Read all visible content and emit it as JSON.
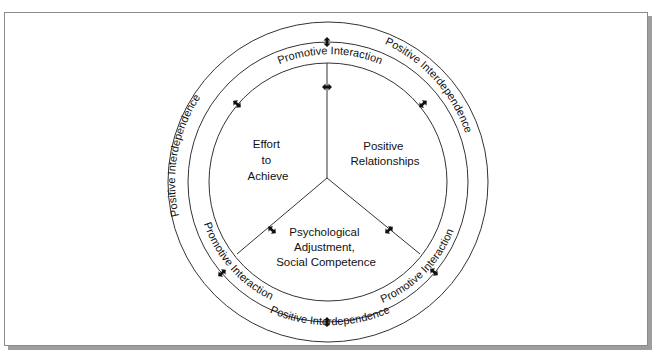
{
  "diagram": {
    "outer_ring_label": "Positive Interdependence",
    "inner_ring_label": "Promotive Interaction",
    "sectors": [
      {
        "id": "effort",
        "lines": [
          "Effort",
          "to",
          "Achieve"
        ]
      },
      {
        "id": "relationships",
        "lines": [
          "Positive",
          "Relationships"
        ]
      },
      {
        "id": "psych",
        "lines": [
          "Psychological",
          "Adjustment,",
          "Social Competence"
        ]
      }
    ],
    "arrow_icon": "bidirectional-arrow-icon",
    "colors": {
      "line": "#333333",
      "text": "#111111",
      "frame": "#8a8a8a",
      "shadow": "#9e9e9e"
    }
  }
}
